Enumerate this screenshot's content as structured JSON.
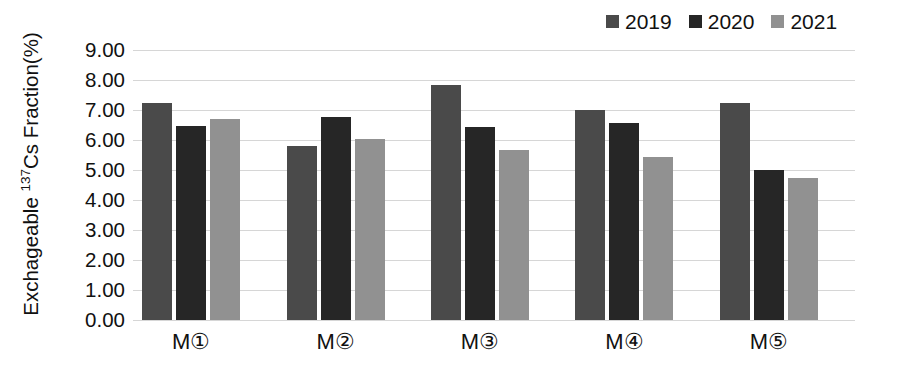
{
  "chart_data": {
    "type": "bar",
    "title": "",
    "xlabel": "",
    "ylabel": "Exchageable 137Cs Fraction(%)",
    "ylabel_prefix": "Exchageable ",
    "ylabel_superscript": "137",
    "ylabel_suffix": "Cs Fraction(%)",
    "categories": [
      "M①",
      "M②",
      "M③",
      "M④",
      "M⑤"
    ],
    "series": [
      {
        "name": "2019",
        "color": "#4a4a4a",
        "values": [
          7.22,
          5.8,
          7.85,
          7.0,
          7.24
        ]
      },
      {
        "name": "2020",
        "color": "#262626",
        "values": [
          6.47,
          6.78,
          6.43,
          6.58,
          5.0
        ]
      },
      {
        "name": "2021",
        "color": "#919191",
        "values": [
          6.71,
          6.05,
          5.68,
          5.42,
          4.72
        ]
      }
    ],
    "ylim": [
      0,
      9
    ],
    "ytick_values": [
      9.0,
      8.0,
      7.0,
      6.0,
      5.0,
      4.0,
      3.0,
      2.0,
      1.0,
      0.0
    ],
    "ytick_labels": [
      "9.00",
      "8.00",
      "7.00",
      "6.00",
      "5.00",
      "4.00",
      "3.00",
      "2.00",
      "1.00",
      "0.00"
    ],
    "grid": true,
    "grid_color": "#d6d6d6",
    "legend_position": "top-right",
    "background": "#ffffff"
  },
  "legend": {
    "entries": [
      {
        "label": "2019",
        "color": "#4a4a4a"
      },
      {
        "label": "2020",
        "color": "#262626"
      },
      {
        "label": "2021",
        "color": "#919191"
      }
    ]
  }
}
